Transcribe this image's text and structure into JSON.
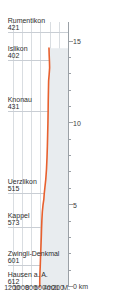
{
  "chart_data": {
    "type": "area",
    "title": "",
    "xlabel": "0 km",
    "ylabel": "m ü. M.",
    "xlim": [
      0,
      16.2
    ],
    "ylim": [
      0,
      1300
    ],
    "grid": true,
    "legend": null,
    "orientation": "rotated-90",
    "line_color": "#e8602e",
    "fill_color": "#e8ecef",
    "grid_color": "#d9dde1",
    "axis_color": "#9aa0a6",
    "x_ticks": [
      0,
      1,
      2,
      3,
      4,
      5,
      6,
      7,
      8,
      9,
      10,
      11,
      12,
      13,
      14,
      15
    ],
    "x_tick_labels": [
      "0 km",
      "",
      "",
      "",
      "",
      "5",
      "",
      "",
      "",
      "",
      "10",
      "",
      "",
      "",
      "",
      "15"
    ],
    "y_ticks": [
      200,
      400,
      600,
      800,
      1000,
      1200
    ],
    "y_tick_labels": [
      "200",
      "400",
      "600",
      "800",
      "1000",
      "1200"
    ],
    "x": [
      0.0,
      0.35,
      0.8,
      1.3,
      1.9,
      2.5,
      3.1,
      3.6,
      4.1,
      4.6,
      5.0,
      5.35,
      5.7,
      6.1,
      6.6,
      7.2,
      7.9,
      8.6,
      9.3,
      10.0,
      10.7,
      11.4,
      12.0,
      12.6,
      13.0,
      13.4,
      13.8,
      14.2,
      14.6
    ],
    "y": [
      612,
      612,
      609,
      601,
      594,
      586,
      578,
      573,
      566,
      556,
      542,
      524,
      515,
      500,
      481,
      466,
      455,
      447,
      441,
      435,
      431,
      428,
      424,
      420,
      408,
      398,
      402,
      408,
      412
    ],
    "stations": [
      {
        "name": "Hausen a. A.",
        "elevation": "612",
        "km": 0.0
      },
      {
        "name": "Zwingli-Denkmal",
        "elevation": "601",
        "km": 1.3
      },
      {
        "name": "Kappel",
        "elevation": "573",
        "km": 3.6
      },
      {
        "name": "Uerzlikon",
        "elevation": "515",
        "km": 5.7
      },
      {
        "name": "Knonau",
        "elevation": "431",
        "km": 10.7
      },
      {
        "name": "Islikon",
        "elevation": "402",
        "km": 13.8
      },
      {
        "name": "Rumentikon",
        "elevation": "421",
        "km": 15.5
      }
    ]
  }
}
